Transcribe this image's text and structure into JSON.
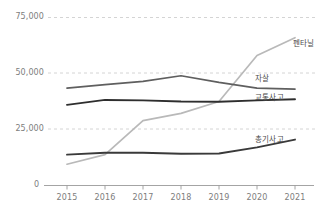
{
  "chart_data": {
    "type": "line",
    "title": "",
    "subtitle": "",
    "xlabel": "",
    "ylabel": "",
    "grid": true,
    "legend_position": "end-of-line",
    "x": [
      2015,
      2016,
      2017,
      2018,
      2019,
      2020,
      2021
    ],
    "xtick_labels": [
      "2015",
      "2016",
      "2017",
      "2018",
      "2019",
      "2020",
      "2021"
    ],
    "ytick_labels": [
      "0",
      "25,000",
      "50,000",
      "75,000"
    ],
    "ytick_values": [
      0,
      25000,
      50000,
      75000
    ],
    "ylim": [
      0,
      78000
    ],
    "xlim": [
      2014.8,
      2021.4
    ],
    "series": [
      {
        "name": "펜타닐",
        "color": "#b9b9b9",
        "values": [
          9500,
          13800,
          29000,
          32200,
          37500,
          58000,
          66000
        ]
      },
      {
        "name": "자살",
        "color": "#5f5f5f",
        "values": [
          43500,
          45000,
          46500,
          49000,
          46000,
          43500,
          43000
        ]
      },
      {
        "name": "교통사고",
        "color": "#2e2e2e",
        "values": [
          36000,
          38200,
          38000,
          37500,
          37400,
          38000,
          38500
        ]
      },
      {
        "name": "총기사고",
        "color": "#3a3a3a",
        "values": [
          13800,
          14600,
          14600,
          14200,
          14300,
          17000,
          20500
        ]
      }
    ]
  },
  "axis": {
    "y_labels": [
      {
        "text": "75,000",
        "value": 75000
      },
      {
        "text": "50,000",
        "value": 50000
      },
      {
        "text": "25,000",
        "value": 25000
      },
      {
        "text": "0",
        "value": 0
      }
    ],
    "x_labels": [
      "2015",
      "2016",
      "2017",
      "2018",
      "2019",
      "2020",
      "2021"
    ]
  },
  "labels": {
    "fentanyl": "펜타닐",
    "suicide": "자살",
    "traffic_accident": "교통사고",
    "gun_accident": "총기사고"
  },
  "colors": {
    "fentanyl": "#b9b9b9",
    "suicide": "#5f5f5f",
    "traffic": "#2e2e2e",
    "gun": "#3a3a3a",
    "grid": "#c9c9c9",
    "axis": "#9a9a9a",
    "tick_text": "#7d7d7d"
  }
}
